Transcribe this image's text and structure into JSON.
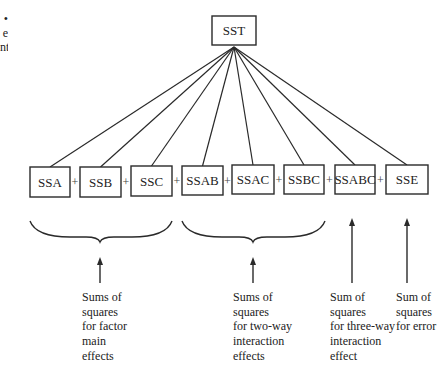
{
  "margin_fragment": {
    "lines": [
      "•",
      "e",
      "nt"
    ]
  },
  "diagram": {
    "root": {
      "label": "SST",
      "x": 212,
      "y": 16,
      "w": 44,
      "h": 29,
      "apex": [
        234,
        47
      ]
    },
    "components": [
      {
        "label": "SSA",
        "x": 30,
        "y": 167,
        "w": 40,
        "h": 30
      },
      {
        "label": "SSB",
        "x": 80,
        "y": 167,
        "w": 41,
        "h": 30
      },
      {
        "label": "SSC",
        "x": 131,
        "y": 166,
        "w": 41,
        "h": 30
      },
      {
        "label": "SSAB",
        "x": 182,
        "y": 166,
        "w": 41,
        "h": 29
      },
      {
        "label": "SSAC",
        "x": 232,
        "y": 165,
        "w": 42,
        "h": 29
      },
      {
        "label": "SSBC",
        "x": 284,
        "y": 165,
        "w": 40,
        "h": 29
      },
      {
        "label": "SSABC",
        "x": 335,
        "y": 165,
        "w": 40,
        "h": 29
      },
      {
        "label": "SSE",
        "x": 386,
        "y": 165,
        "w": 42,
        "h": 29
      }
    ],
    "operator": "+",
    "braces": [
      {
        "x1": 30,
        "x2": 172,
        "y": 221,
        "tip": [
          100,
          242
        ]
      },
      {
        "x1": 182,
        "x2": 325,
        "y": 221,
        "tip": [
          253,
          242
        ]
      }
    ],
    "arrows": [
      {
        "x": 100,
        "y1": 283,
        "y2": 257
      },
      {
        "x": 253,
        "y1": 283,
        "y2": 257
      },
      {
        "x": 352,
        "y1": 283,
        "y2": 218
      },
      {
        "x": 407,
        "y1": 283,
        "y2": 218
      }
    ],
    "captions": [
      {
        "x": 82,
        "y": 290,
        "lines": [
          "Sums of",
          "squares",
          "for factor",
          "main",
          "effects"
        ]
      },
      {
        "x": 233,
        "y": 290,
        "lines": [
          "Sums of",
          "squares",
          "for two-way",
          "interaction",
          "effects"
        ]
      },
      {
        "x": 330,
        "y": 290,
        "lines": [
          "Sum of",
          "squares",
          "for three-way",
          "interaction",
          "effect"
        ]
      },
      {
        "x": 396,
        "y": 290,
        "lines": [
          "Sum of",
          "squares",
          "for error"
        ]
      }
    ]
  }
}
